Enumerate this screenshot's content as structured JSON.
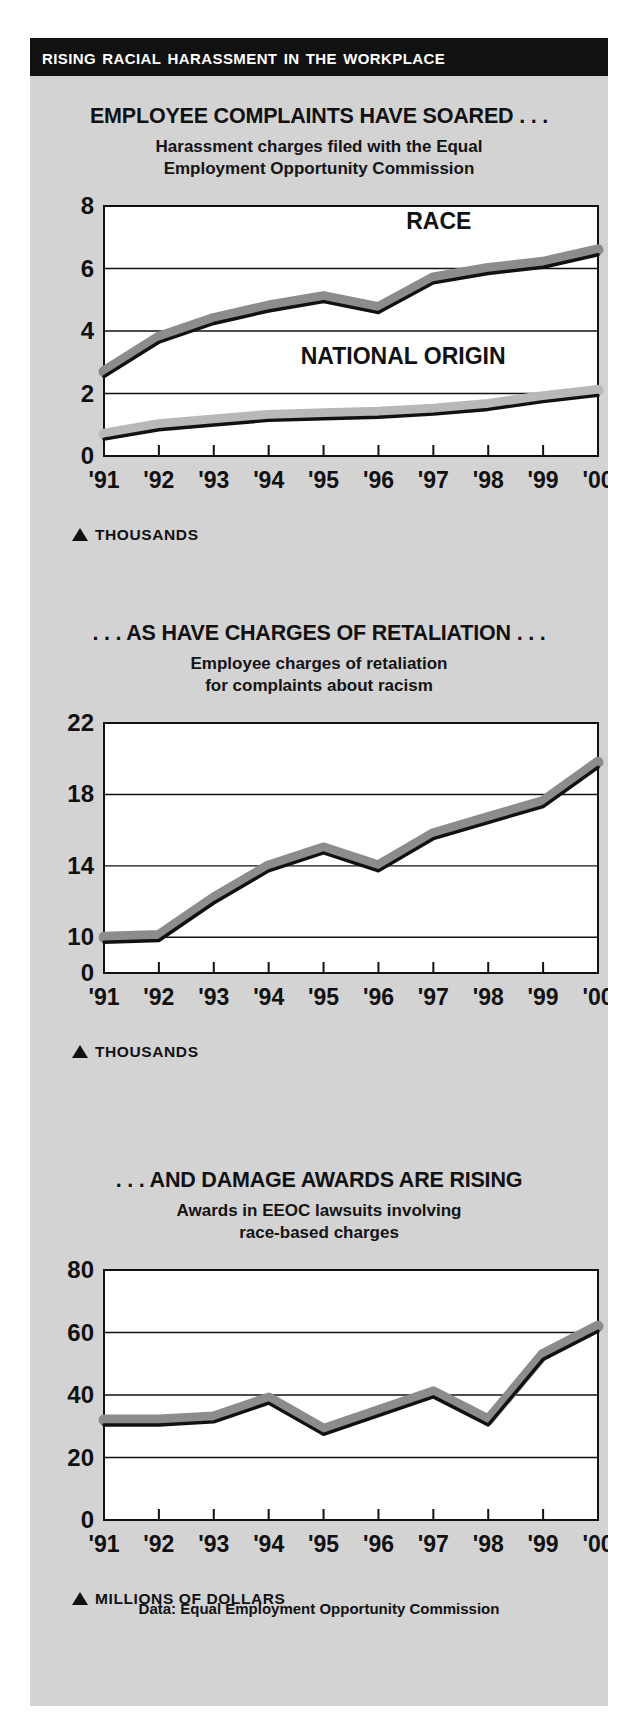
{
  "banner": {
    "title": "Rising Racial Harassment in the Workplace"
  },
  "source_note": "Data: Equal Employment Opportunity Commission",
  "colors": {
    "panel_bg": "#d3d3d3",
    "banner_bg": "#111111",
    "plot_bg": "#ffffff",
    "series_race": "#8c8c8c",
    "series_national_origin": "#b8b8b8",
    "series_line": "#111111",
    "grid": "#111111"
  },
  "sections": [
    {
      "id": "complaints",
      "title": "EMPLOYEE COMPLAINTS HAVE SOARED . . .",
      "subtitle_line1": "Harassment charges filed with the Equal",
      "subtitle_line2": "Employment Opportunity Commission",
      "unit_label": "THOUSANDS",
      "unit_marker": "triangle-up-icon"
    },
    {
      "id": "retaliation",
      "title": ". . . AS HAVE CHARGES OF RETALIATION . . .",
      "subtitle_line1": "Employee charges of retaliation",
      "subtitle_line2": "for complaints about racism",
      "unit_label": "THOUSANDS",
      "unit_marker": "triangle-up-icon"
    },
    {
      "id": "damages",
      "title": ". . . AND DAMAGE AWARDS ARE RISING",
      "subtitle_line1": "Awards in EEOC lawsuits involving",
      "subtitle_line2": "race-based charges",
      "unit_label": "MILLIONS OF DOLLARS",
      "unit_marker": "triangle-up-icon"
    }
  ],
  "chart_data": [
    {
      "type": "line",
      "id": "complaints",
      "title": "EMPLOYEE COMPLAINTS HAVE SOARED . . .",
      "subtitle": "Harassment charges filed with the Equal Employment Opportunity Commission",
      "xlabel": "",
      "ylabel": "THOUSANDS",
      "categories": [
        "'91",
        "'92",
        "'93",
        "'94",
        "'95",
        "'96",
        "'97",
        "'98",
        "'99",
        "'00"
      ],
      "x": [
        "'91",
        "'92",
        "'93",
        "'94",
        "'95",
        "'96",
        "'97",
        "'98",
        "'99",
        "'00"
      ],
      "ylim": [
        0,
        8
      ],
      "yticks": [
        0,
        2,
        4,
        6,
        8
      ],
      "ytick_labels": [
        "0",
        "2",
        "4",
        "6",
        "8"
      ],
      "gridlines": [
        2,
        4,
        6
      ],
      "grid": true,
      "legend": "inline-annotations",
      "series": [
        {
          "name": "RACE",
          "label_position": "upper-right-inside",
          "color": "#8c8c8c",
          "values": [
            2.7,
            3.8,
            4.4,
            4.8,
            5.1,
            4.75,
            5.7,
            6.0,
            6.2,
            6.6
          ]
        },
        {
          "name": "NATIONAL ORIGIN",
          "label_position": "mid-right-inside",
          "color": "#b8b8b8",
          "values": [
            0.7,
            1.0,
            1.15,
            1.3,
            1.35,
            1.4,
            1.5,
            1.65,
            1.9,
            2.1
          ]
        }
      ]
    },
    {
      "type": "line",
      "id": "retaliation",
      "title": ". . . AS HAVE CHARGES OF RETALIATION . . .",
      "subtitle": "Employee charges of retaliation for complaints about racism",
      "xlabel": "",
      "ylabel": "THOUSANDS",
      "categories": [
        "'91",
        "'92",
        "'93",
        "'94",
        "'95",
        "'96",
        "'97",
        "'98",
        "'99",
        "'00"
      ],
      "x": [
        "'91",
        "'92",
        "'93",
        "'94",
        "'95",
        "'96",
        "'97",
        "'98",
        "'99",
        "'00"
      ],
      "ylim": [
        8,
        22
      ],
      "axis_break": true,
      "yticks": [
        0,
        10,
        14,
        18,
        22
      ],
      "ytick_labels": [
        "0",
        "10",
        "14",
        "18",
        "22"
      ],
      "gridlines": [
        10,
        14,
        18
      ],
      "grid": true,
      "series": [
        {
          "name": "Retaliation charges",
          "color": "#8c8c8c",
          "values": [
            10.0,
            10.1,
            12.2,
            14.0,
            15.0,
            14.0,
            15.8,
            16.7,
            17.6,
            19.8
          ]
        }
      ]
    },
    {
      "type": "line",
      "id": "damages",
      "title": ". . . AND DAMAGE AWARDS ARE RISING",
      "subtitle": "Awards in EEOC lawsuits involving race-based charges",
      "xlabel": "",
      "ylabel": "MILLIONS OF DOLLARS",
      "categories": [
        "'91",
        "'92",
        "'93",
        "'94",
        "'95",
        "'96",
        "'97",
        "'98",
        "'99",
        "'00"
      ],
      "x": [
        "'91",
        "'92",
        "'93",
        "'94",
        "'95",
        "'96",
        "'97",
        "'98",
        "'99",
        "'00"
      ],
      "ylim": [
        0,
        80
      ],
      "yticks": [
        0,
        20,
        40,
        60,
        80
      ],
      "ytick_labels": [
        "0",
        "20",
        "40",
        "60",
        "80"
      ],
      "gridlines": [
        20,
        40,
        60
      ],
      "grid": true,
      "series": [
        {
          "name": "Damage awards",
          "color": "#8c8c8c",
          "values": [
            32,
            32,
            33,
            39,
            29,
            35,
            41,
            32,
            53,
            62
          ]
        }
      ]
    }
  ]
}
